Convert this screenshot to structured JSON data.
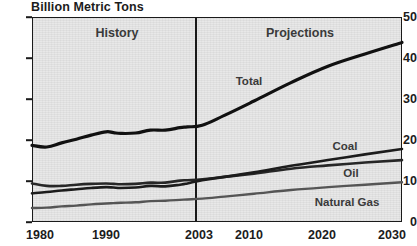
{
  "chart_data": {
    "type": "line",
    "title": "Billion Metric Tons",
    "xlabel": "",
    "ylabel": "Billion Metric Tons",
    "xlim": [
      1980,
      2030
    ],
    "ylim": [
      0,
      50
    ],
    "grid": false,
    "legend_position": "inline-annotations",
    "y_ticks": [
      "0",
      "10",
      "20",
      "30",
      "40",
      "50"
    ],
    "x_ticks": [
      "1980",
      "1990",
      "2003",
      "2010",
      "2020",
      "2030"
    ],
    "annotations": [
      {
        "text": "History",
        "x": 1991.5,
        "y": 47
      },
      {
        "text": "Projections",
        "x": 2016,
        "y": 47
      },
      {
        "text": "Total",
        "x": 2009,
        "y": 34.5
      },
      {
        "text": "Coal",
        "x": 2022,
        "y": 18.8
      },
      {
        "text": "Oil",
        "x": 2023,
        "y": 12.0
      },
      {
        "text": "Natural Gas",
        "x": 2022,
        "y": 4.9
      }
    ],
    "divider": {
      "x": 2003,
      "label": "history-projections-divider"
    },
    "x": [
      1980,
      1982,
      1984,
      1986,
      1988,
      1990,
      1991,
      1992,
      1994,
      1996,
      1998,
      2000,
      2001,
      2003,
      2006,
      2010,
      2015,
      2020,
      2025,
      2030
    ],
    "series": [
      {
        "name": "Total",
        "values": [
          18.7,
          18.3,
          19.3,
          20.2,
          21.2,
          22.0,
          21.8,
          21.6,
          21.7,
          22.4,
          22.4,
          23.0,
          23.2,
          23.6,
          26.0,
          29.5,
          34.0,
          38.0,
          41.0,
          43.8
        ]
      },
      {
        "name": "Oil",
        "values": [
          9.4,
          8.8,
          8.8,
          9.1,
          9.3,
          9.4,
          9.3,
          9.2,
          9.3,
          9.6,
          9.6,
          10.1,
          10.2,
          10.4,
          11.0,
          11.8,
          13.0,
          13.8,
          14.5,
          15.1
        ]
      },
      {
        "name": "Coal",
        "values": [
          7.0,
          7.3,
          7.7,
          8.0,
          8.3,
          8.5,
          8.4,
          8.3,
          8.4,
          8.8,
          8.7,
          9.1,
          9.4,
          10.2,
          11.0,
          12.1,
          13.7,
          15.1,
          16.5,
          17.8
        ]
      },
      {
        "name": "Natural Gas",
        "values": [
          3.4,
          3.5,
          3.8,
          4.0,
          4.3,
          4.5,
          4.6,
          4.7,
          4.8,
          5.1,
          5.2,
          5.4,
          5.5,
          5.7,
          6.2,
          6.9,
          7.8,
          8.5,
          9.1,
          9.7
        ]
      }
    ]
  },
  "colors": {
    "plot_background": "#e6e6e6",
    "axis": "#1a1a1a",
    "total_line": "#111111",
    "coal_line": "#1c1c1c",
    "oil_line": "#272727",
    "gas_line": "#555555",
    "text": "#1c1c1c"
  }
}
